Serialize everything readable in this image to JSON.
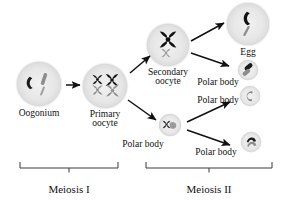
{
  "figure": {
    "title_visible": false,
    "type": "oogenesis-flow-diagram",
    "background_color": "#ffffff",
    "ink_color": "#111111"
  },
  "cells": [
    {
      "id": "oogonium",
      "label": "Oogonium",
      "label_line2": "",
      "cx": 39,
      "cy": 84,
      "r": 22,
      "fill": "#e9e9e9",
      "label_x": 39,
      "label_y": 109,
      "font_size": 9.5,
      "chromosomes": [
        {
          "shape": "hook-dark",
          "color": "#1a1a1a"
        },
        {
          "shape": "rod-gray",
          "color": "#8a8a8a"
        },
        {
          "shape": "rod-thin-gray",
          "color": "#9a9a9a"
        }
      ]
    },
    {
      "id": "primary-oocyte",
      "label": "Primary",
      "label_line2": "oocyte",
      "cx": 105,
      "cy": 86,
      "r": 22,
      "fill": "#e9e9e9",
      "label_x": 105,
      "label_y": 110,
      "font_size": 9.5,
      "chromosomes": [
        {
          "shape": "x-dark-small",
          "color": "#1a1a1a"
        },
        {
          "shape": "x-dark-large",
          "color": "#1a1a1a"
        },
        {
          "shape": "x-gray-small",
          "color": "#8e8e8e"
        },
        {
          "shape": "x-gray-large",
          "color": "#8e8e8e"
        }
      ]
    },
    {
      "id": "secondary-oocyte",
      "label": "Secondary",
      "label_line2": "oocyte",
      "cx": 168,
      "cy": 45,
      "r": 21,
      "fill": "#e9e9e9",
      "label_x": 168,
      "label_y": 68,
      "font_size": 9.5,
      "chromosomes": [
        {
          "shape": "x-dark-big",
          "color": "#111111"
        },
        {
          "shape": "x-gray-small",
          "color": "#9a9a9a"
        }
      ]
    },
    {
      "id": "egg",
      "label": "Egg",
      "label_line2": "",
      "cx": 248,
      "cy": 24,
      "r": 21,
      "fill": "#e9e9e9",
      "label_x": 248,
      "label_y": 48,
      "font_size": 9.5,
      "chromosomes": [
        {
          "shape": "hook-dark",
          "color": "#111111"
        },
        {
          "shape": "rod-thin-gray",
          "color": "#8e8e8e"
        }
      ]
    },
    {
      "id": "polar-body-1",
      "label": "Polar body",
      "label_line2": "",
      "cx": 170,
      "cy": 125,
      "r": 11,
      "fill": "#ececec",
      "label_x": 143,
      "label_y": 140,
      "font_size": 9.5,
      "chromosomes": [
        {
          "shape": "x-dark-tiny",
          "color": "#1a1a1a"
        },
        {
          "shape": "blob-gray",
          "color": "#9a9a9a"
        }
      ]
    },
    {
      "id": "polar-body-2",
      "label": "Polar body",
      "label_line2": "",
      "cx": 248,
      "cy": 70,
      "r": 10,
      "fill": "#ececec",
      "label_x": 218,
      "label_y": 78,
      "font_size": 9.5,
      "chromosomes": [
        {
          "shape": "bar-dark",
          "color": "#1a1a1a"
        },
        {
          "shape": "bar-gray",
          "color": "#8e8e8e"
        }
      ]
    },
    {
      "id": "polar-body-3",
      "label": "Polar body",
      "label_line2": "",
      "cx": 250,
      "cy": 96,
      "r": 10,
      "fill": "#ececec",
      "label_x": 218,
      "label_y": 96,
      "font_size": 9.5,
      "chromosomes": [
        {
          "shape": "c-gray",
          "color": "#8a8a8a"
        }
      ]
    },
    {
      "id": "polar-body-4",
      "label": "Polar body",
      "label_line2": "",
      "cx": 251,
      "cy": 142,
      "r": 10,
      "fill": "#ececec",
      "label_x": 216,
      "label_y": 148,
      "font_size": 9.5,
      "chromosomes": [
        {
          "shape": "arc-dark",
          "color": "#1a1a1a"
        },
        {
          "shape": "arc-gray",
          "color": "#8e8e8e"
        }
      ]
    }
  ],
  "arrows": [
    {
      "id": "oogonium-to-primary",
      "x1": 66,
      "y1": 85,
      "x2": 80,
      "y2": 85
    },
    {
      "id": "primary-to-secondary",
      "x1": 130,
      "y1": 73,
      "x2": 150,
      "y2": 56
    },
    {
      "id": "primary-to-polar-body-1",
      "x1": 128,
      "y1": 100,
      "x2": 156,
      "y2": 120
    },
    {
      "id": "secondary-to-egg",
      "x1": 191,
      "y1": 41,
      "x2": 224,
      "y2": 23
    },
    {
      "id": "secondary-to-polar-body-2",
      "x1": 191,
      "y1": 53,
      "x2": 229,
      "y2": 66
    },
    {
      "id": "polar-body-1-to-polar-body-3",
      "x1": 187,
      "y1": 122,
      "x2": 230,
      "y2": 102
    },
    {
      "id": "polar-body-1-to-polar-body-4",
      "x1": 187,
      "y1": 130,
      "x2": 230,
      "y2": 145
    }
  ],
  "phases": [
    {
      "id": "meiosis-1",
      "label": "Meiosis I",
      "bracket_left": 20,
      "bracket_right": 118,
      "bracket_y": 168,
      "tick_x": 69,
      "label_x": 69,
      "label_y": 183,
      "font_size": 11
    },
    {
      "id": "meiosis-2",
      "label": "Meiosis II",
      "bracket_left": 146,
      "bracket_right": 272,
      "bracket_y": 168,
      "tick_x": 209,
      "label_x": 209,
      "label_y": 183,
      "font_size": 11
    }
  ]
}
